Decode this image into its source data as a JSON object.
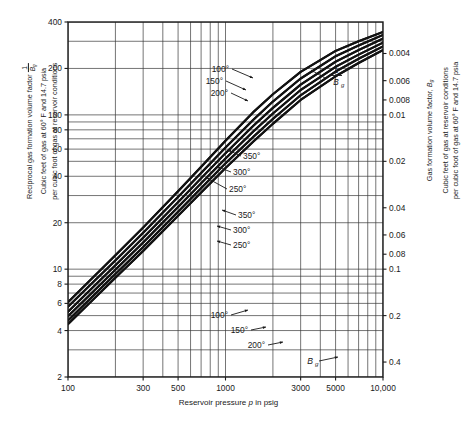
{
  "axes": {
    "x": {
      "label_prefix": "Reservoir pressure ",
      "label_var": "p",
      "label_suffix": " in psig",
      "ticks": [
        "100",
        "300",
        "500",
        "1000",
        "3000",
        "5000",
        "10,000"
      ],
      "tick_values": [
        100,
        300,
        500,
        1000,
        3000,
        5000,
        10000
      ],
      "range": [
        100,
        10000
      ],
      "scale": "log"
    },
    "y_left": {
      "title_line1": "Reciprocal gas formation volume factor",
      "title_frac_num": "1",
      "title_frac_den_var": "B",
      "title_frac_den_sub": "g",
      "title_line2": "Cubic feet of gas at 60° F and 14.7 psia",
      "title_line3": "per cubic foot of gas at reservoir conditions",
      "ticks": [
        "400",
        "200",
        "100",
        "80",
        "60",
        "40",
        "20",
        "10",
        "8",
        "6",
        "4",
        "2"
      ],
      "tick_values": [
        400,
        200,
        100,
        80,
        60,
        40,
        20,
        10,
        8,
        6,
        4,
        2
      ],
      "range": [
        2,
        400
      ],
      "scale": "log"
    },
    "y_right": {
      "title_line1": "Gas formation volume factor, ",
      "title_var": "B",
      "title_sub": "g",
      "title_line2": "Cubic feet of gas at reservoir conditions",
      "title_line3": "per cubic foot of gas at 60° F and 14.7 psia",
      "ticks": [
        "0.4",
        "0.2",
        "0.1",
        "0.08",
        "0.06",
        "0.04",
        "0.02",
        "0.01",
        "0.008",
        "0.006",
        "0.004",
        "0.002"
      ],
      "tick_values": [
        0.4,
        0.2,
        0.1,
        0.08,
        0.06,
        0.04,
        0.02,
        0.01,
        0.008,
        0.006,
        0.004,
        0.002
      ],
      "range": [
        0.0025,
        0.5
      ],
      "scale": "log"
    }
  },
  "annotations": {
    "upper_temps": [
      "100°",
      "150°",
      "200°"
    ],
    "mid_upper_temps": [
      "350°",
      "300°",
      "250°"
    ],
    "mid_lower_temps": [
      "350°",
      "300°",
      "250°"
    ],
    "lower_temps": [
      "100°",
      "150°",
      "200°"
    ],
    "recip_label_num": "1",
    "recip_label_den_var": "B",
    "recip_label_den_sub": "g",
    "bg_label_var": "B",
    "bg_label_sub": "g"
  },
  "chart_data": {
    "type": "line",
    "title": "",
    "xlabel": "Reservoir pressure p in psig",
    "ylabel": "Reciprocal gas formation volume factor 1/Bg",
    "ylabel_right": "Gas formation volume factor, Bg",
    "xscale": "log",
    "yscale": "log",
    "xlim": [
      100,
      10000
    ],
    "ylim": [
      2,
      400
    ],
    "ylim_right": [
      0.0025,
      0.5
    ],
    "grid": true,
    "legend": "inline-annotations",
    "series": [
      {
        "name": "1/Bg 100°F",
        "family": "reciprocal",
        "temperature_F": 100,
        "x": [
          100,
          200,
          300,
          500,
          700,
          1000,
          1500,
          2000,
          3000,
          5000,
          7000,
          10000
        ],
        "y": [
          6.1,
          12.3,
          18.6,
          32.0,
          46.0,
          68.0,
          104.0,
          136.0,
          190.0,
          260.0,
          300.0,
          345.0
        ]
      },
      {
        "name": "1/Bg 150°F",
        "family": "reciprocal",
        "temperature_F": 150,
        "x": [
          100,
          200,
          300,
          500,
          700,
          1000,
          1500,
          2000,
          3000,
          5000,
          7000,
          10000
        ],
        "y": [
          5.7,
          11.4,
          17.2,
          29.4,
          42.0,
          61.5,
          93.0,
          122.0,
          172.0,
          240.0,
          282.0,
          330.0
        ]
      },
      {
        "name": "1/Bg 200°F",
        "family": "reciprocal",
        "temperature_F": 200,
        "x": [
          100,
          200,
          300,
          500,
          700,
          1000,
          1500,
          2000,
          3000,
          5000,
          7000,
          10000
        ],
        "y": [
          5.3,
          10.6,
          16.0,
          27.2,
          38.8,
          56.5,
          85.0,
          111.0,
          157.0,
          221.0,
          263.0,
          312.0
        ]
      },
      {
        "name": "1/Bg 250°F",
        "family": "reciprocal",
        "temperature_F": 250,
        "x": [
          100,
          200,
          300,
          500,
          700,
          1000,
          1500,
          2000,
          3000,
          5000,
          7000,
          10000
        ],
        "y": [
          4.95,
          9.9,
          14.9,
          25.3,
          36.0,
          52.2,
          78.0,
          102.0,
          145.0,
          205.0,
          246.0,
          294.0
        ]
      },
      {
        "name": "1/Bg 300°F",
        "family": "reciprocal",
        "temperature_F": 300,
        "x": [
          100,
          200,
          300,
          500,
          700,
          1000,
          1500,
          2000,
          3000,
          5000,
          7000,
          10000
        ],
        "y": [
          4.65,
          9.3,
          13.9,
          23.6,
          33.5,
          48.5,
          72.0,
          94.0,
          134.0,
          191.0,
          231.0,
          278.0
        ]
      },
      {
        "name": "1/Bg 350°F",
        "family": "reciprocal",
        "temperature_F": 350,
        "x": [
          100,
          200,
          300,
          500,
          700,
          1000,
          1500,
          2000,
          3000,
          5000,
          7000,
          10000
        ],
        "y": [
          4.4,
          8.8,
          13.1,
          22.2,
          31.4,
          45.3,
          67.0,
          87.5,
          125.0,
          178.0,
          217.0,
          263.0
        ]
      },
      {
        "name": "Bg 100°F",
        "family": "formation",
        "temperature_F": 100,
        "x": [
          100,
          200,
          300,
          500,
          700,
          1000,
          1500,
          2000,
          3000,
          5000,
          7000,
          10000
        ],
        "y_right": [
          0.164,
          0.0813,
          0.0538,
          0.0313,
          0.0217,
          0.0147,
          0.0096,
          0.00735,
          0.00526,
          0.00385,
          0.00333,
          0.0029
        ]
      },
      {
        "name": "Bg 150°F",
        "family": "formation",
        "temperature_F": 150,
        "x": [
          100,
          200,
          300,
          500,
          700,
          1000,
          1500,
          2000,
          3000,
          5000,
          7000,
          10000
        ],
        "y_right": [
          0.175,
          0.0877,
          0.0581,
          0.034,
          0.0238,
          0.0163,
          0.0108,
          0.0082,
          0.00581,
          0.00417,
          0.00355,
          0.00303
        ]
      },
      {
        "name": "Bg 200°F",
        "family": "formation",
        "temperature_F": 200,
        "x": [
          100,
          200,
          300,
          500,
          700,
          1000,
          1500,
          2000,
          3000,
          5000,
          7000,
          10000
        ],
        "y_right": [
          0.189,
          0.0943,
          0.0625,
          0.0368,
          0.0258,
          0.0177,
          0.0118,
          0.009,
          0.00637,
          0.00452,
          0.0038,
          0.0032
        ]
      },
      {
        "name": "Bg 250°F",
        "family": "formation",
        "temperature_F": 250,
        "x": [
          100,
          200,
          300,
          500,
          700,
          1000,
          1500,
          2000,
          3000,
          5000,
          7000,
          10000
        ],
        "y_right": [
          0.202,
          0.101,
          0.0671,
          0.0395,
          0.0278,
          0.0192,
          0.0128,
          0.0098,
          0.0069,
          0.00488,
          0.00407,
          0.0034
        ]
      },
      {
        "name": "Bg 300°F",
        "family": "formation",
        "temperature_F": 300,
        "x": [
          100,
          200,
          300,
          500,
          700,
          1000,
          1500,
          2000,
          3000,
          5000,
          7000,
          10000
        ],
        "y_right": [
          0.215,
          0.1075,
          0.072,
          0.0424,
          0.0299,
          0.0206,
          0.0139,
          0.0106,
          0.00746,
          0.00524,
          0.00433,
          0.0036
        ]
      },
      {
        "name": "Bg 350°F",
        "family": "formation",
        "temperature_F": 350,
        "x": [
          100,
          200,
          300,
          500,
          700,
          1000,
          1500,
          2000,
          3000,
          5000,
          7000,
          10000
        ],
        "y_right": [
          0.227,
          0.1136,
          0.0763,
          0.045,
          0.0318,
          0.0221,
          0.0149,
          0.0114,
          0.008,
          0.00562,
          0.00461,
          0.0038
        ]
      }
    ]
  }
}
